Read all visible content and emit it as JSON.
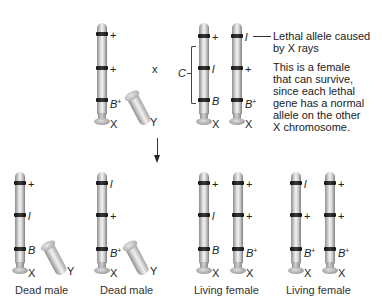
{
  "figure": {
    "cross_symbol": "x",
    "parents": {
      "male": {
        "x_chromosome": {
          "bands": [
            {
              "allele": "+",
              "italic": false
            },
            {
              "allele": "+",
              "italic": false
            },
            {
              "allele": "B",
              "sup": "+",
              "italic": true
            }
          ],
          "label": "X"
        },
        "y_label": "Y"
      },
      "female": {
        "bracket_label": "C",
        "chromosome_1": {
          "bands": [
            {
              "allele": "+",
              "italic": false
            },
            {
              "allele": "l",
              "italic": true
            },
            {
              "allele": "B",
              "italic": true
            }
          ],
          "label": "X"
        },
        "chromosome_2": {
          "bands": [
            {
              "allele": "l",
              "italic": true
            },
            {
              "allele": "+",
              "italic": false
            },
            {
              "allele": "B",
              "sup": "+",
              "italic": true
            }
          ],
          "label": "X"
        },
        "annotation_lethal": [
          "Lethal allele caused",
          "by X rays"
        ],
        "annotation_female": [
          "This is a female",
          "that can survive,",
          "since each lethal",
          "gene has a normal",
          "allele on the other",
          "X chromosome."
        ]
      }
    },
    "offspring": [
      {
        "caption": "Dead male",
        "x_chromosome": {
          "bands": [
            {
              "allele": "+"
            },
            {
              "allele": "l",
              "italic": true
            },
            {
              "allele": "B",
              "italic": true
            }
          ],
          "label": "X"
        },
        "y_label": "Y"
      },
      {
        "caption": "Dead male",
        "x_chromosome": {
          "bands": [
            {
              "allele": "l",
              "italic": true
            },
            {
              "allele": "+"
            },
            {
              "allele": "B",
              "sup": "+",
              "italic": true
            }
          ],
          "label": "X"
        },
        "y_label": "Y"
      },
      {
        "caption": "Living female",
        "chromosome_1": {
          "bands": [
            {
              "allele": "+"
            },
            {
              "allele": "l",
              "italic": true
            },
            {
              "allele": "B",
              "italic": true
            }
          ],
          "label": "X"
        },
        "chromosome_2": {
          "bands": [
            {
              "allele": "+"
            },
            {
              "allele": "+"
            },
            {
              "allele": "B",
              "sup": "+",
              "italic": true
            }
          ],
          "label": "X"
        }
      },
      {
        "caption": "Living female",
        "chromosome_1": {
          "bands": [
            {
              "allele": "l",
              "italic": true
            },
            {
              "allele": "+"
            },
            {
              "allele": "B",
              "sup": "+",
              "italic": true
            }
          ],
          "label": "X"
        },
        "chromosome_2": {
          "bands": [
            {
              "allele": "+"
            },
            {
              "allele": "+"
            },
            {
              "allele": "B",
              "sup": "+",
              "italic": true
            }
          ],
          "label": "X"
        }
      }
    ]
  }
}
